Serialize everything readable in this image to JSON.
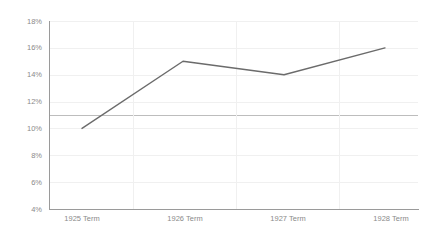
{
  "chart_data": {
    "type": "line",
    "title": "",
    "subtitle": "",
    "xlabel": "",
    "ylabel": "",
    "categories": [
      "1925 Term",
      "1926 Term",
      "1927 Term",
      "1928 Term"
    ],
    "series": [
      {
        "name": "",
        "values": [
          10,
          15,
          14,
          16
        ],
        "color": "#6b6b6b"
      }
    ],
    "value_suffix": "%",
    "ylim": [
      4,
      18
    ],
    "ytick_step": 2,
    "ytick_labels": [
      "18%",
      "16%",
      "14%",
      "12%",
      "10%",
      "8%",
      "6%",
      "4%"
    ],
    "ytick_values": [
      18,
      16,
      14,
      12,
      10,
      8,
      6,
      4
    ],
    "xtick_labels": [
      "1925 Term",
      "1926 Term",
      "1927 Term",
      "1928 Term"
    ],
    "grid": {
      "horizontal": true,
      "vertical": true,
      "vertical_between_categories": true,
      "color": "#f0f0f0"
    },
    "reference_line": {
      "value": 11,
      "label": "",
      "color": "#bdbdbd"
    },
    "legend": {
      "visible": false,
      "position": "none"
    },
    "axis_color": "#9a9a9a",
    "tick_label_color": "#8a8a8a",
    "background": "#ffffff"
  }
}
